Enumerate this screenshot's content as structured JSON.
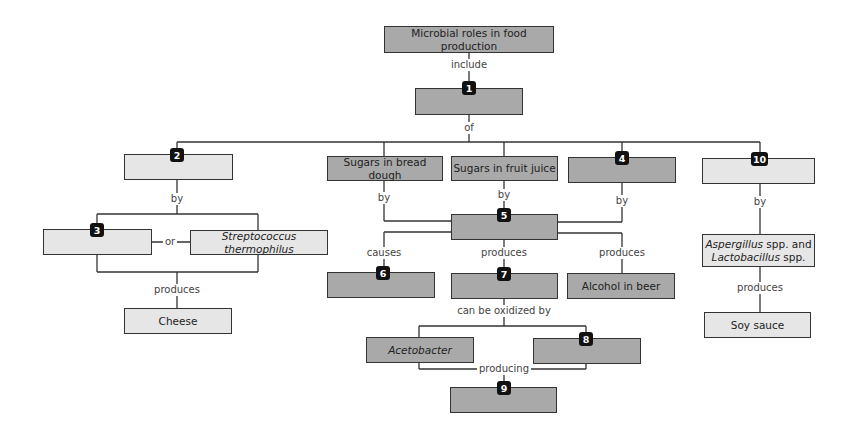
{
  "diagram": {
    "title": "Microbial roles in food production",
    "nodes": [
      {
        "id": "root",
        "text": "Microbial roles in food production"
      },
      {
        "id": "b1",
        "badge": "1",
        "text": ""
      },
      {
        "id": "b2",
        "badge": "2",
        "text": ""
      },
      {
        "id": "bread",
        "text": "Sugars in bread dough"
      },
      {
        "id": "juice",
        "text": "Sugars in fruit juice"
      },
      {
        "id": "b4",
        "badge": "4",
        "text": ""
      },
      {
        "id": "b10",
        "badge": "10",
        "text": ""
      },
      {
        "id": "b3",
        "badge": "3",
        "text": ""
      },
      {
        "id": "strep",
        "text": "Streptococcus thermophilus"
      },
      {
        "id": "cheese",
        "text": "Cheese"
      },
      {
        "id": "b5",
        "badge": "5",
        "text": ""
      },
      {
        "id": "b6",
        "badge": "6",
        "text": ""
      },
      {
        "id": "b7",
        "badge": "7",
        "text": ""
      },
      {
        "id": "beer",
        "text": "Alcohol in beer"
      },
      {
        "id": "asp",
        "text_italic_1": "Aspergillus",
        "text_1": " spp. and",
        "text_italic_2": "Lactobacillus",
        "text_2": " spp."
      },
      {
        "id": "soy",
        "text": "Soy sauce"
      },
      {
        "id": "aceto",
        "text": "Acetobacter"
      },
      {
        "id": "b8",
        "badge": "8",
        "text": ""
      },
      {
        "id": "b9",
        "badge": "9",
        "text": ""
      }
    ],
    "edge_labels": {
      "include": "include",
      "of": "of",
      "by_2": "by",
      "or": "or",
      "produces_cheese": "produces",
      "by_bread": "by",
      "by_juice": "by",
      "by_4": "by",
      "causes": "causes",
      "produces_7": "produces",
      "produces_beer": "produces",
      "can_be_oxidized_by": "can be oxidized by",
      "producing": "producing",
      "by_10": "by",
      "produces_soy": "produces"
    },
    "colors": {
      "dark_box": "#a9a9a9",
      "light_box": "#e6e6e6",
      "badge": "#111111",
      "line": "#333333"
    }
  }
}
